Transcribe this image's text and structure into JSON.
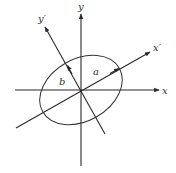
{
  "diagram": {
    "title": "",
    "origin": [
      81,
      90
    ],
    "axes": {
      "x": {
        "label": "x",
        "from": [
          15,
          90
        ],
        "to": [
          159,
          90
        ]
      },
      "y": {
        "label": "y",
        "from": [
          81,
          166
        ],
        "to": [
          81,
          14
        ]
      },
      "x_prime": {
        "label": "x′",
        "from": [
          16,
          128
        ],
        "to": [
          150,
          52
        ]
      },
      "y_prime": {
        "label": "y′",
        "from": [
          105,
          134
        ],
        "to": [
          45,
          27
        ]
      }
    },
    "ellipse": {
      "cx": 81,
      "cy": 90,
      "rx": 44,
      "ry": 31,
      "rotation_deg": -29.5
    },
    "semi_axes": {
      "a": {
        "label": "a"
      },
      "b": {
        "label": "b"
      }
    },
    "colors": {
      "line": "#2a2a2a",
      "text": "#333333",
      "background": "#ffffff"
    }
  }
}
